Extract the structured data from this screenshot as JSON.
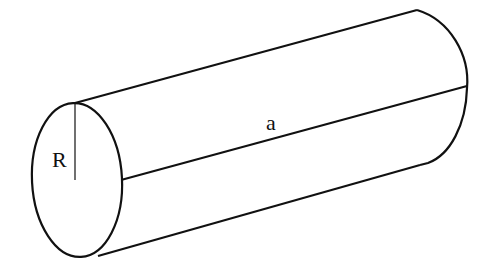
{
  "diagram": {
    "type": "cylinder",
    "labels": {
      "radius": "R",
      "length": "a"
    },
    "colors": {
      "stroke": "#111111",
      "background": "#ffffff"
    }
  }
}
